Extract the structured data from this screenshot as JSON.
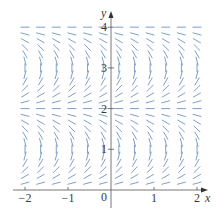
{
  "figure": {
    "type": "slope_field",
    "colors": {
      "segments": "#7f9fc7",
      "axes": "#555555",
      "text": "#3a3a3a",
      "background": "#ffffff"
    },
    "axes": {
      "x_label": "x",
      "y_label": "y",
      "x_ticks": [
        {
          "value": -2,
          "label": "−2"
        },
        {
          "value": -1,
          "label": "−1"
        },
        {
          "value": 1,
          "label": "1"
        },
        {
          "value": 2,
          "label": "2"
        }
      ],
      "origin_label": "0",
      "y_ticks": [
        {
          "value": 1,
          "label": "1"
        },
        {
          "value": 2,
          "label": "2"
        },
        {
          "value": 3,
          "label": "3"
        },
        {
          "value": 4,
          "label": "4"
        }
      ],
      "xlim": [
        -2.2,
        2.2
      ],
      "ylim": [
        -0.4,
        4.3
      ]
    },
    "grid": {
      "columns": 12,
      "x_start": -2,
      "x_end": 2,
      "rows": 24,
      "y_start": 0.1667,
      "y_step": 0.1667,
      "segment_length_px": 9
    },
    "pixel_map": {
      "x0_px": 111,
      "x_unit_px": 43,
      "y0_px": 190,
      "y_unit_px": 40.7
    }
  }
}
